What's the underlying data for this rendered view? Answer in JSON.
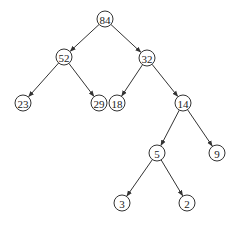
{
  "diagram": {
    "type": "binary-tree",
    "nodes": [
      {
        "id": "n84",
        "label": "84",
        "x": 105,
        "y": 19
      },
      {
        "id": "n52",
        "label": "52",
        "x": 64,
        "y": 57
      },
      {
        "id": "n32",
        "label": "32",
        "x": 147,
        "y": 58
      },
      {
        "id": "n23",
        "label": "23",
        "x": 23,
        "y": 103
      },
      {
        "id": "n29",
        "label": "29",
        "x": 99,
        "y": 103
      },
      {
        "id": "n18",
        "label": "18",
        "x": 117,
        "y": 103
      },
      {
        "id": "n14",
        "label": "14",
        "x": 183,
        "y": 103
      },
      {
        "id": "n5",
        "label": "5",
        "x": 157,
        "y": 153
      },
      {
        "id": "n9",
        "label": "9",
        "x": 217,
        "y": 153
      },
      {
        "id": "n3",
        "label": "3",
        "x": 122,
        "y": 203
      },
      {
        "id": "n2",
        "label": "2",
        "x": 187,
        "y": 203
      }
    ],
    "edges": [
      [
        "n84",
        "n52"
      ],
      [
        "n84",
        "n32"
      ],
      [
        "n52",
        "n23"
      ],
      [
        "n52",
        "n29"
      ],
      [
        "n32",
        "n18"
      ],
      [
        "n32",
        "n14"
      ],
      [
        "n14",
        "n5"
      ],
      [
        "n14",
        "n9"
      ],
      [
        "n5",
        "n3"
      ],
      [
        "n5",
        "n2"
      ]
    ],
    "node_radius": 8
  }
}
